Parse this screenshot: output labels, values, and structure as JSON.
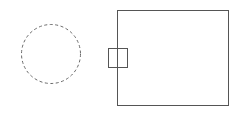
{
  "diagram": {
    "background": "#ffffff",
    "shapes": [
      {
        "id": "dashed-circle",
        "type": "circle",
        "cx": 51,
        "cy": 54,
        "r": 29.5,
        "stroke": "#6a6a6a",
        "dash": "3,2.5",
        "fill": "none"
      },
      {
        "id": "main-box",
        "type": "rect",
        "x": 117.5,
        "y": 10.5,
        "width": 111,
        "height": 95,
        "stroke": "#555555",
        "fill": "none"
      },
      {
        "id": "port-box",
        "type": "rect",
        "x": 108.5,
        "y": 48.5,
        "width": 19,
        "height": 19,
        "stroke": "#555555",
        "fill": "none"
      }
    ]
  }
}
